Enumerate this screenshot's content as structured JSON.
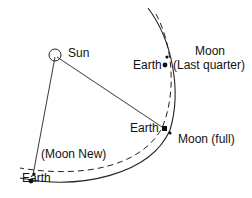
{
  "diagram": {
    "labels": {
      "sun": "Sun",
      "moon_last_quarter_line1": "Moon",
      "moon_last_quarter_line2": "(Last quarter)",
      "earth_last_quarter": "Earth",
      "earth_full": "Earth",
      "moon_full": "Moon (full)",
      "moon_new": "(Moon New)",
      "earth_new": "Earth"
    },
    "colors": {
      "stroke": "#222222",
      "text": "#111111"
    }
  }
}
